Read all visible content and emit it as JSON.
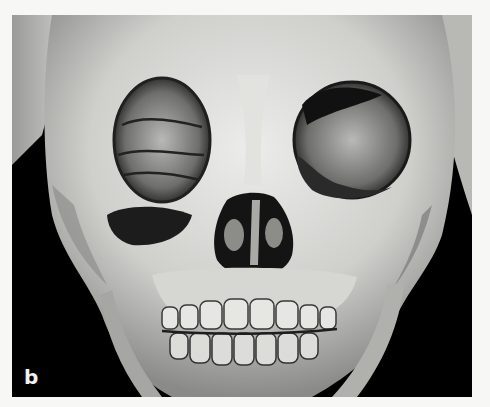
{
  "figure": {
    "panel_label": "b",
    "image_description": "3D CT volume rendering of a skull, frontal view, showing orbits, nasal cavity, maxilla and mandible with mixed dentition",
    "background_color": "#000000",
    "page_color": "#f7f7f5"
  }
}
